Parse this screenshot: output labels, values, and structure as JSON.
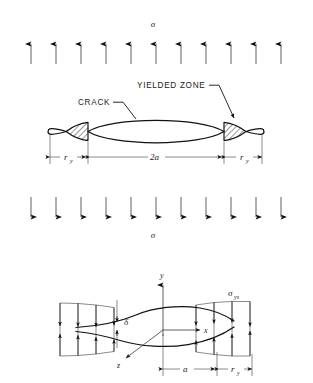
{
  "figure": {
    "title_symbols": {
      "sigma_top": "σ",
      "sigma_bottom": "σ",
      "sigma_ys_base": "σ",
      "sigma_ys_sub": "ys"
    },
    "top_panel": {
      "name": "dugdale-strip-yield-crack-model",
      "load_label_top": "σ",
      "load_label_bottom": "σ",
      "arrow_count_up": 11,
      "arrow_count_down": 11,
      "callouts": [
        {
          "id": "crack",
          "text": "CRACK"
        },
        {
          "id": "yielded-zone",
          "text": "YIELDED ZONE"
        }
      ],
      "dimensions": [
        {
          "id": "ry-left",
          "base": "r",
          "sub": "y"
        },
        {
          "id": "two-a",
          "base": "2a",
          "sub": ""
        },
        {
          "id": "ry-right",
          "base": "r",
          "sub": "y"
        }
      ]
    },
    "bottom_panel": {
      "name": "crack-tip-opening-displacement-detail",
      "axes": [
        {
          "id": "x-axis",
          "label": "x"
        },
        {
          "id": "y-axis",
          "label": "y"
        },
        {
          "id": "z-axis",
          "label": "z"
        }
      ],
      "cod_label": "δ",
      "yield_stress_base": "σ",
      "yield_stress_sub": "ys",
      "dimensions": [
        {
          "id": "a",
          "base": "a",
          "sub": ""
        },
        {
          "id": "ry",
          "base": "r",
          "sub": "y"
        }
      ]
    },
    "colors": {
      "ink": "#111111",
      "paper": "#ffffff",
      "hatch": "#1a1a1a"
    }
  }
}
